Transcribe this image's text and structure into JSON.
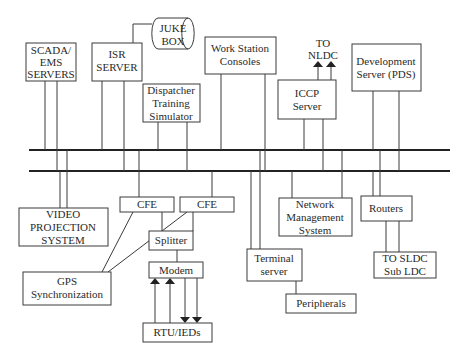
{
  "diagram": {
    "type": "network-architecture",
    "buses": [
      "upper-lan",
      "lower-lan"
    ],
    "nodes": {
      "scada_ems": {
        "lines": [
          "SCADA/",
          "EMS",
          "SERVERS"
        ]
      },
      "isr_server": {
        "lines": [
          "ISR",
          "SERVER"
        ]
      },
      "juke_box": {
        "lines": [
          "JUKE",
          "BOX"
        ]
      },
      "dispatcher_training": {
        "lines": [
          "Dispatcher",
          "Training",
          "Simulator"
        ]
      },
      "work_station": {
        "lines": [
          "Work Station",
          "Consoles"
        ]
      },
      "to_nldc": {
        "lines": [
          "TO",
          "NLDC"
        ]
      },
      "iccp_server": {
        "lines": [
          "ICCP",
          "Server"
        ]
      },
      "development_server": {
        "lines": [
          "Development",
          "Server (PDS)"
        ]
      },
      "video_projection": {
        "lines": [
          "VIDEO",
          "PROJECTION",
          "SYSTEM"
        ]
      },
      "cfe_1": {
        "lines": [
          "CFE"
        ]
      },
      "cfe_2": {
        "lines": [
          "CFE"
        ]
      },
      "splitter": {
        "lines": [
          "Splitter"
        ]
      },
      "modem": {
        "lines": [
          "Modem"
        ]
      },
      "gps_sync": {
        "lines": [
          "GPS",
          "Synchronization"
        ]
      },
      "rtu_ieds": {
        "lines": [
          "RTU/IEDs"
        ]
      },
      "terminal_server": {
        "lines": [
          "Terminal",
          "server"
        ]
      },
      "peripherals": {
        "lines": [
          "Peripherals"
        ]
      },
      "network_management": {
        "lines": [
          "Network",
          "Management",
          "System"
        ]
      },
      "routers": {
        "lines": [
          "Routers"
        ]
      },
      "to_sldc": {
        "lines": [
          "TO SLDC",
          "Sub LDC"
        ]
      }
    },
    "colors": {
      "stroke": "#3a3a3a",
      "bus": "#222222",
      "text": "#2a2a2a",
      "background": "#ffffff"
    }
  }
}
